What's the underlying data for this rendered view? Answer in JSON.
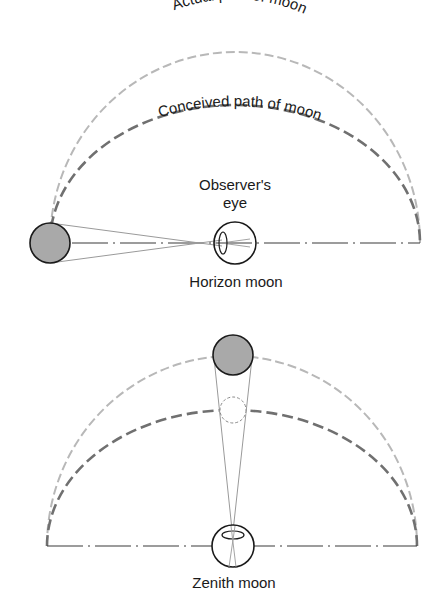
{
  "figure": {
    "top_panel": {
      "labels": {
        "actual_path": "Actual path of moon",
        "conceived_path": "Conceived path of moon",
        "observer_line1": "Observer's",
        "observer_line2": "eye",
        "caption": "Horizon moon"
      }
    },
    "bottom_panel": {
      "labels": {
        "caption": "Zenith moon"
      }
    },
    "colors": {
      "actual_path": "#b8b8b8",
      "conceived_path": "#707070",
      "moon_fill": "#a9a9a9",
      "outline": "#1a1a1a",
      "sight_lines": "#9a9a9a",
      "horizon_line": "#3a3a3a"
    }
  }
}
